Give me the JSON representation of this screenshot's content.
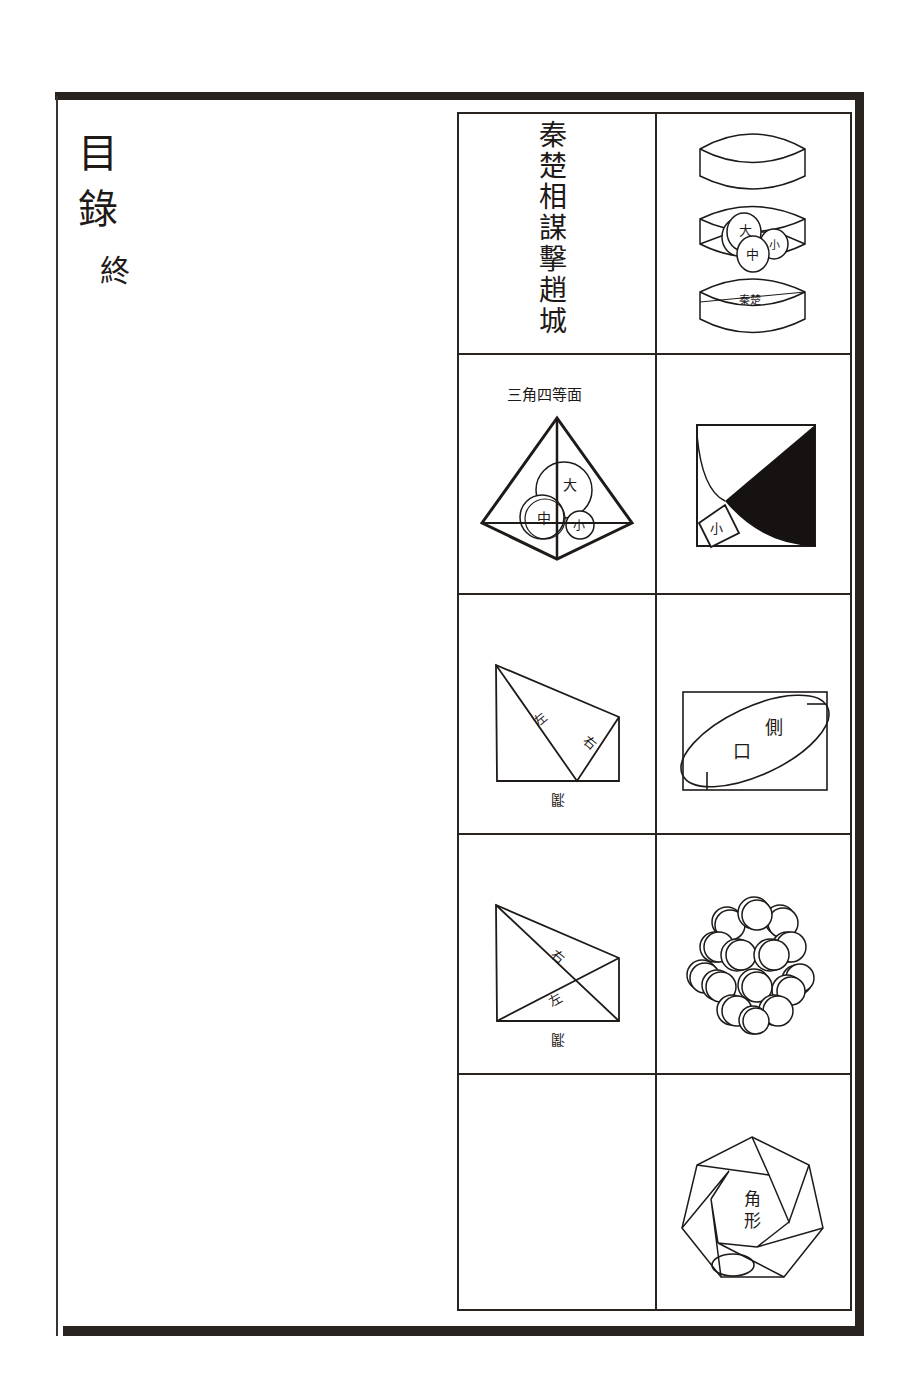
{
  "page": {
    "title_chars": [
      "目",
      "錄"
    ],
    "end_mark": "終"
  },
  "table": {
    "rows": [
      {
        "left": {
          "type": "title",
          "text_chars": [
            "秦",
            "楚",
            "相",
            "謀",
            "擊",
            "趙",
            "城"
          ]
        },
        "right": {
          "type": "figure",
          "figure": "three-stacked-elliptic-boxes",
          "labels": [
            "大",
            "中",
            "小"
          ]
        }
      },
      {
        "left": {
          "type": "figure",
          "figure": "tetrahedron-with-spheres",
          "caption": "三角四等面",
          "labels": [
            "大",
            "中",
            "小"
          ]
        },
        "right": {
          "type": "figure",
          "figure": "square-with-shaded-quarter",
          "labels": [
            "小"
          ]
        }
      },
      {
        "left": {
          "type": "figure",
          "figure": "quadrilateral-with-diagonal",
          "labels": [
            "左",
            "右",
            "濶"
          ]
        },
        "right": {
          "type": "figure",
          "figure": "rectangle-with-ellipse",
          "labels": [
            "側",
            "口"
          ]
        }
      },
      {
        "left": {
          "type": "figure",
          "figure": "quadrilateral-crossed-diagonals",
          "labels": [
            "右",
            "左",
            "濶"
          ]
        },
        "right": {
          "type": "figure",
          "figure": "sphere-cluster",
          "labels": []
        }
      },
      {
        "left": {
          "type": "empty"
        },
        "right": {
          "type": "figure",
          "figure": "heptagon-spiral",
          "labels": [
            "角",
            "形"
          ]
        }
      }
    ]
  },
  "colors": {
    "ink": "#1e1a18",
    "frame": "#2a2421",
    "paper": "#ffffff",
    "fill_dark": "#151211"
  }
}
